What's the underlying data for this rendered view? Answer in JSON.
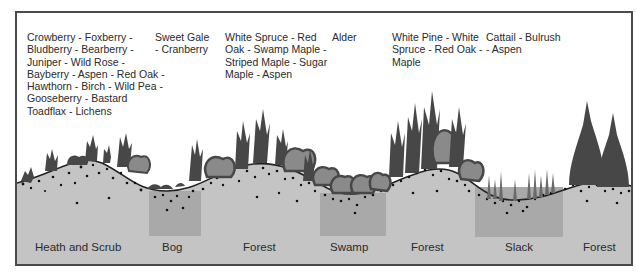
{
  "vegetation": [
    {
      "zone": "Heath and Scrub",
      "lines": [
        "Crowberry - Foxberry -",
        "Bludberry - Bearberry -",
        "Juniper - Wild Rose -",
        "Bayberry - Aspen - Red Oak -",
        "Hawthorn - Birch - Wild Pea -",
        "Gooseberry - Bastard",
        "Toadflax - Lichens"
      ]
    },
    {
      "zone": "Bog",
      "lines": [
        "Sweet Gale",
        "- Cranberry"
      ]
    },
    {
      "zone": "Forest",
      "lines": [
        "White Spruce - Red",
        "Oak - Swamp Maple -",
        "Striped Maple - Sugar",
        "Maple - Aspen"
      ]
    },
    {
      "zone": "Swamp",
      "lines": [
        "Alder"
      ]
    },
    {
      "zone": "Forest",
      "lines": [
        "White Pine - White",
        "Spruce - Red Oak -",
        "Maple"
      ]
    },
    {
      "zone": "Slack",
      "lines": [
        "Cattail - Bulrush",
        "- Aspen"
      ]
    }
  ],
  "zones": [
    {
      "label": "Heath and Scrub"
    },
    {
      "label": "Bog"
    },
    {
      "label": "Forest"
    },
    {
      "label": "Swamp"
    },
    {
      "label": "Forest"
    },
    {
      "label": "Slack"
    },
    {
      "label": "Forest"
    }
  ],
  "colors": {
    "ground": "#c4c4c4",
    "wet_basin": "#a9a9a9",
    "tree_dark": "#474747",
    "tree_light": "#8a8a8a",
    "text": "#2a2a2a",
    "border": "#4a4a4a"
  }
}
